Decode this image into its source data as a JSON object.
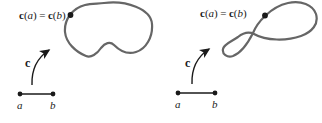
{
  "colors": {
    "curve": "#666666",
    "ink": "#1a1a1a",
    "background": "#ffffff"
  },
  "left_figure": {
    "curve_label_parts": [
      "c",
      "(",
      "a",
      ")",
      "=",
      "c",
      "(",
      "b",
      ")"
    ],
    "map_label": "c",
    "endpoint_a_label": "a",
    "endpoint_b_label": "b"
  },
  "right_figure": {
    "curve_label_parts": [
      "c",
      "(",
      "a",
      ")",
      "=",
      "c",
      "(",
      "b",
      ")"
    ],
    "map_label": "c",
    "endpoint_a_label": "a",
    "endpoint_b_label": "b"
  }
}
